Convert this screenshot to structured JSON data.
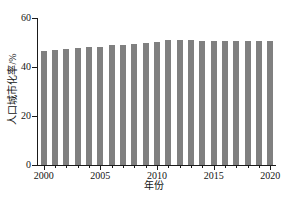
{
  "chart_data": {
    "type": "bar",
    "title": "",
    "subtitle": "",
    "xlabel": "年份",
    "ylabel": "人口城市化率/%",
    "categories": [
      "2000",
      "2001",
      "2002",
      "2003",
      "2004",
      "2005",
      "2006",
      "2007",
      "2008",
      "2009",
      "2010",
      "2011",
      "2012",
      "2013",
      "2014",
      "2015",
      "2016",
      "2017",
      "2018",
      "2019",
      "2020"
    ],
    "values": [
      46.5,
      46.9,
      47.2,
      47.7,
      48.0,
      48.3,
      48.8,
      49.1,
      49.3,
      49.9,
      50.4,
      51.2,
      50.9,
      50.9,
      50.8,
      50.8,
      50.8,
      50.8,
      50.8,
      50.8,
      50.8
    ],
    "series": [
      {
        "name": "人口城市化率",
        "values": [
          46.5,
          46.9,
          47.2,
          47.7,
          48.0,
          48.3,
          48.8,
          49.1,
          49.3,
          49.9,
          50.4,
          51.2,
          50.9,
          50.9,
          50.8,
          50.8,
          50.8,
          50.8,
          50.8,
          50.8,
          50.8
        ],
        "color": "#808080"
      }
    ],
    "ylim": [
      0,
      60
    ],
    "yticks": [
      0,
      20,
      40,
      60
    ],
    "ytick_labels": [
      "0",
      "20",
      "40",
      "60"
    ],
    "xlim": [
      1999.5,
      2020.5
    ],
    "xticks": [
      2000,
      2005,
      2010,
      2015,
      2020
    ],
    "xtick_labels": [
      "2000",
      "2005",
      "2010",
      "2015",
      "2020"
    ],
    "grid": false,
    "legend": null,
    "legend_position": "none",
    "bar_color": "#808080",
    "axis_color": "#1a1a1a",
    "background": "#ffffff"
  }
}
